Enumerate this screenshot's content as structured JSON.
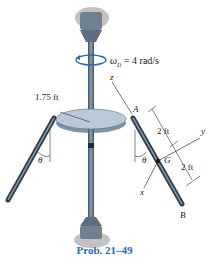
{
  "figure": {
    "omega_label": "ω",
    "omega_sub": "D",
    "omega_value": "= 4 rad/s",
    "radius_label": "1.75 ft",
    "point_A": "A",
    "point_B": "B",
    "point_G": "G",
    "axis_z": "z",
    "axis_y": "y",
    "axis_x": "x",
    "theta_left": "θ",
    "theta_right": "θ",
    "dim_upper": "2 ft",
    "dim_lower": "2 ft",
    "caption": "Prob. 21–49",
    "colors": {
      "rod": "#5a6e80",
      "disk": "#b9c9d8",
      "caption": "#2a6db5"
    }
  }
}
